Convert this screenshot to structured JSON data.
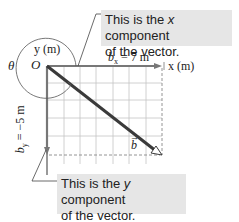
{
  "callouts": {
    "x_component": {
      "pre": "This is the ",
      "var": "x",
      "post": " component",
      "line2": "of the vector."
    },
    "y_component": {
      "pre": "This is the ",
      "var": "y",
      "post": " component",
      "line2": "of the vector."
    }
  },
  "axes": {
    "y_label": "y (m)",
    "x_label": "x (m)",
    "origin_label": "O",
    "angle_label": "θ"
  },
  "components": {
    "bx_label": "b",
    "bx_sub": "x",
    "bx_value": " = 7 m",
    "by_label": "b",
    "by_sub": "y",
    "by_value": " = −5 m"
  },
  "vector": {
    "label": "b",
    "arrow": "→"
  },
  "colors": {
    "grid": "#bdbdbd",
    "vector": "#3a3a3a",
    "axis": "#555555",
    "callout_bg": "#e6e6e6"
  }
}
